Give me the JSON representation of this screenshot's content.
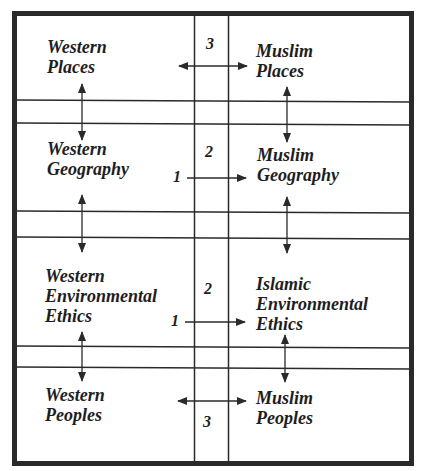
{
  "diagram": {
    "colors": {
      "line": "#2a2a2a",
      "text": "#1e1e1e",
      "background": "#ffffff"
    },
    "rows": [
      {
        "left": {
          "lines": [
            "Western",
            "Places"
          ]
        },
        "right": {
          "lines": [
            "Muslim",
            "Places"
          ]
        },
        "connector": {
          "type": "bidirectional",
          "label": "3"
        }
      },
      {
        "left": {
          "lines": [
            "Western",
            "Geography"
          ]
        },
        "right": {
          "lines": [
            "Muslim",
            "Geography"
          ]
        },
        "connector": {
          "type": "right-arrow",
          "label_start": "1",
          "label_center": "2"
        }
      },
      {
        "left": {
          "lines": [
            "Western",
            "Environmental",
            "Ethics"
          ]
        },
        "right": {
          "lines": [
            "Islamic",
            "Environmental",
            "Ethics"
          ]
        },
        "connector": {
          "type": "right-arrow",
          "label_start": "1",
          "label_center": "2"
        }
      },
      {
        "left": {
          "lines": [
            "Western",
            "Peoples"
          ]
        },
        "right": {
          "lines": [
            "Muslim",
            "Peoples"
          ]
        },
        "connector": {
          "type": "bidirectional",
          "label": "3"
        }
      }
    ]
  }
}
